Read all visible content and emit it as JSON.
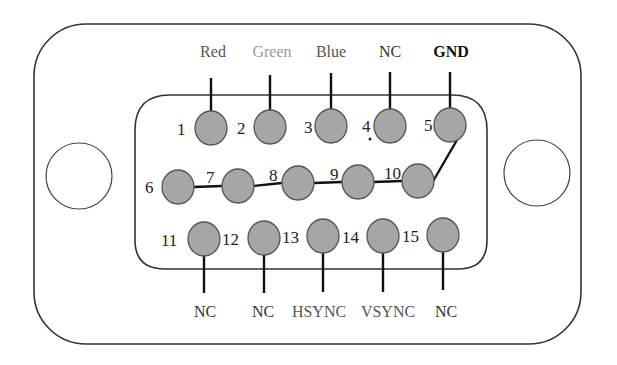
{
  "colors": {
    "frame": "#333333",
    "pin_fill": "#a6a6a6",
    "pin_stroke": "#555555",
    "wire": "#111111",
    "label_red": "#555555",
    "label_green": "#9a9a9a",
    "label_blue": "#555555",
    "label_dark": "#222222"
  },
  "top_labels": [
    {
      "text": "Red",
      "pin": 1
    },
    {
      "text": "Green",
      "pin": 2
    },
    {
      "text": "Blue",
      "pin": 3
    },
    {
      "text": "NC",
      "pin": 4
    },
    {
      "text": "GND",
      "pin": 5
    }
  ],
  "bottom_labels": [
    {
      "text": "NC",
      "pin": 11
    },
    {
      "text": "NC",
      "pin": 12
    },
    {
      "text": "HSYNC",
      "pin": 13
    },
    {
      "text": "VSYNC",
      "pin": 14
    },
    {
      "text": "NC",
      "pin": 15
    }
  ],
  "pins": {
    "row1": [
      "1",
      "2",
      "3",
      "4",
      "5"
    ],
    "row2": [
      "6",
      "7",
      "8",
      "9",
      "10"
    ],
    "row3": [
      "11",
      "12",
      "13",
      "14",
      "15"
    ]
  },
  "connections": "Pins 6, 7, 8, 9, 10 tied together and connected to pin 5 (GND)"
}
